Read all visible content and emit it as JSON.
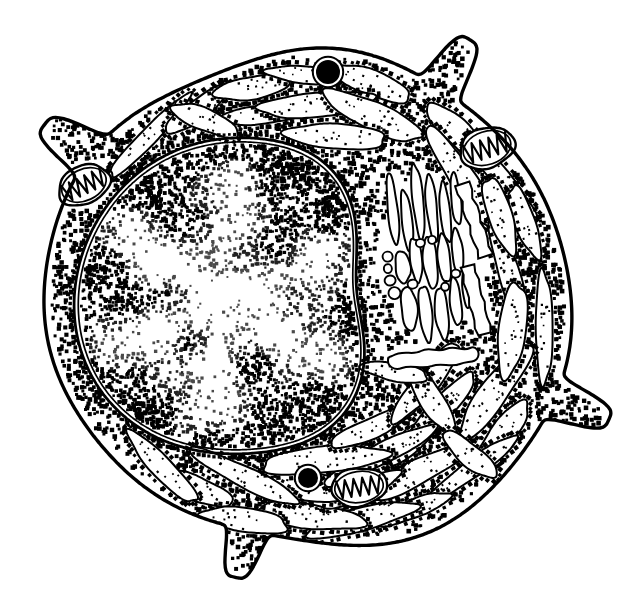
{
  "figure": {
    "title": "Plasma cell ultrastructure line drawing",
    "style": "black-and-white pen-and-ink stipple scientific illustration",
    "background_color": "#ffffff",
    "ink_color": "#000000",
    "width": 627,
    "height": 613,
    "caption": "",
    "labels_present": false
  },
  "structures": {
    "cell_membrane": {
      "name": "plasma membrane",
      "stroke_width": 3.2,
      "shape": "rounded irregular oval",
      "center": [
        310,
        300
      ],
      "radius_x": 272,
      "radius_y": 262
    },
    "cytoplasm": {
      "name": "cytoplasm / cytosol",
      "fill": "#ffffff",
      "stipple": "free ribosomes drawn as dense square dots",
      "ribosome_dot_size": 3.2,
      "ribosome_count": 1500
    },
    "nucleus": {
      "name": "nucleus",
      "position": "left of center, occupying left half of cell",
      "center": [
        232,
        298
      ],
      "radius_x": 158,
      "radius_y": 162,
      "envelope": "double membrane, outer membrane studded with ribosomes",
      "envelope_stroke_width": 2.6,
      "chromatin": "patchy heterochromatin stipple with pale euchromatin channels forming a star pattern",
      "nucleolus_visible": false
    },
    "rough_er": {
      "name": "rough endoplasmic reticulum",
      "description": "elongated flattened cisternae with lightly stippled lumen, outlined by ribosome dots, arranged concentrically parallel to the plasma membrane",
      "cisterna_count": 48,
      "lumen_stipple": "sparse fine dots",
      "outline_stroke_width": 2.0
    },
    "golgi": {
      "name": "Golgi apparatus",
      "description": "stack of smooth unstippled elongated cisternae plus small round transport vesicles, right of the nucleus",
      "center": [
        432,
        258
      ],
      "cisterna_count": 14,
      "vesicle_count": 9,
      "stroke_width": 2.0
    },
    "mitochondria": [
      {
        "id": "mitochondrion-upper-left",
        "center": [
          84,
          185
        ],
        "rx": 27,
        "ry": 19,
        "rotation": -25,
        "cristae": 5
      },
      {
        "id": "mitochondrion-upper-right",
        "center": [
          487,
          148
        ],
        "rx": 28,
        "ry": 20,
        "rotation": -18,
        "cristae": 5
      },
      {
        "id": "mitochondrion-lower-center",
        "center": [
          359,
          487
        ],
        "rx": 28,
        "ry": 19,
        "rotation": -8,
        "cristae": 5
      }
    ],
    "dense_granules": [
      {
        "id": "dense-granule-top",
        "center": [
          328,
          72
        ],
        "r": 12,
        "fill": "#000000",
        "halo": true
      },
      {
        "id": "dense-granule-bottom",
        "center": [
          308,
          478
        ],
        "r": 10,
        "fill": "#000000",
        "halo": true
      }
    ],
    "projections": [
      {
        "id": "projection-upper-left",
        "tip": [
          52,
          123
        ],
        "direction": "upper-left",
        "length": 46
      },
      {
        "id": "projection-upper-right",
        "tip": [
          468,
          33
        ],
        "direction": "up",
        "length": 48
      },
      {
        "id": "projection-right",
        "tip": [
          594,
          418
        ],
        "direction": "right",
        "length": 52
      },
      {
        "id": "projection-bottom",
        "tip": [
          238,
          578
        ],
        "direction": "down",
        "length": 42
      }
    ]
  },
  "legend": {
    "visible": false,
    "entries": []
  }
}
